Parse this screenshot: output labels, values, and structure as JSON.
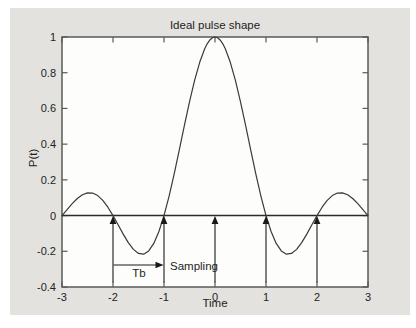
{
  "figure": {
    "title": "Ideal pulse shape",
    "xlabel": "Time",
    "ylabel": "P(t)"
  },
  "annotations": {
    "tb_label": "Tb",
    "sampling_label": "Sampling"
  },
  "chart_data": {
    "type": "line",
    "title": "Ideal pulse shape",
    "xlabel": "Time",
    "ylabel": "P(t)",
    "xlim": [
      -3,
      3
    ],
    "ylim": [
      -0.4,
      1
    ],
    "grid": false,
    "legend": "none",
    "x_ticks": [
      -3,
      -2,
      -1,
      0,
      1,
      2,
      3
    ],
    "y_ticks": [
      -0.4,
      -0.2,
      0,
      0.2,
      0.4,
      0.6,
      0.8,
      1
    ],
    "x_tick_labels": [
      "-3",
      "-2",
      "-1",
      "0",
      "1",
      "2",
      "3"
    ],
    "y_tick_labels": [
      "-0.4",
      "-0.2",
      "0",
      "0.2",
      "0.4",
      "0.6",
      "0.8",
      "1"
    ],
    "series": [
      {
        "name": "ideal sinc pulse p(t)=sin(pi t)/(pi t)",
        "x": [
          -3,
          -2.9,
          -2.8,
          -2.7,
          -2.6,
          -2.5,
          -2.4,
          -2.3,
          -2.2,
          -2.1,
          -2,
          -1.9,
          -1.8,
          -1.7,
          -1.6,
          -1.5,
          -1.4,
          -1.3,
          -1.2,
          -1.1,
          -1,
          -0.9,
          -0.8,
          -0.7,
          -0.6,
          -0.5,
          -0.4,
          -0.3,
          -0.2,
          -0.15,
          -0.1,
          -0.05,
          0,
          0.05,
          0.1,
          0.15,
          0.2,
          0.3,
          0.4,
          0.5,
          0.6,
          0.7,
          0.8,
          0.9,
          1,
          1.1,
          1.2,
          1.3,
          1.4,
          1.5,
          1.6,
          1.7,
          1.8,
          1.9,
          2,
          2.1,
          2.2,
          2.3,
          2.4,
          2.5,
          2.6,
          2.7,
          2.8,
          2.9,
          3
        ],
        "y": [
          0,
          0.0339,
          0.0668,
          0.0954,
          0.1164,
          0.1273,
          0.1261,
          0.112,
          0.085,
          0.0468,
          0,
          -0.0518,
          -0.1039,
          -0.1515,
          -0.1892,
          -0.2122,
          -0.2162,
          -0.1981,
          -0.1559,
          -0.0894,
          0,
          0.1093,
          0.2339,
          0.3679,
          0.5046,
          0.6366,
          0.7568,
          0.8584,
          0.9355,
          0.9634,
          0.9836,
          0.9959,
          1,
          0.9959,
          0.9836,
          0.9634,
          0.9355,
          0.8584,
          0.7568,
          0.6366,
          0.5046,
          0.3679,
          0.2339,
          0.1093,
          0,
          -0.0894,
          -0.1559,
          -0.1981,
          -0.2162,
          -0.2122,
          -0.1892,
          -0.1515,
          -0.1039,
          -0.0518,
          0,
          0.0468,
          0.085,
          0.112,
          0.1261,
          0.1273,
          0.1164,
          0.0954,
          0.0668,
          0.0339,
          0
        ]
      }
    ],
    "zero_line": true,
    "sampling_arrows": {
      "x": [
        -2,
        -1,
        0,
        1,
        2
      ],
      "y_from": -0.375,
      "y_to": 0
    },
    "tb_arrow": {
      "x_from": -2,
      "x_to": -1,
      "y": -0.277
    },
    "colors": {
      "figure_bg": "#e3e2df",
      "plot_bg": "#fdfdfb",
      "box": "#5a5a5a",
      "curve": "#3a3a3a",
      "zero_line": "#2b2b2b",
      "arrow": "#1a1a1a",
      "text": "#1e1e1e"
    }
  }
}
